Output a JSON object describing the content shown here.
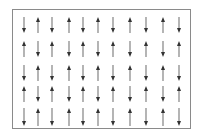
{
  "diagram": {
    "type": "spin-lattice",
    "frame_color": "#8a8a8a",
    "arrow_color": "#333333",
    "columns_x": [
      24,
      38,
      52,
      69,
      83,
      98,
      113,
      130,
      146,
      163,
      179
    ],
    "rows": [
      {
        "y_top": 17,
        "y_bottom": 33,
        "dirs": [
          "down",
          "up",
          "down",
          "up",
          "down",
          "up",
          "down",
          "up",
          "down",
          "up",
          "down"
        ]
      },
      {
        "y_top": 41,
        "y_bottom": 57,
        "dirs": [
          "up",
          "down",
          "up",
          "down",
          "up",
          "down",
          "up",
          "down",
          "up",
          "down",
          "up"
        ]
      },
      {
        "y_top": 65,
        "y_bottom": 81,
        "dirs": [
          "down",
          "up",
          "down",
          "up",
          "down",
          "up",
          "down",
          "up",
          "down",
          "up",
          "down"
        ]
      },
      {
        "y_top": 86,
        "y_bottom": 102,
        "dirs": [
          "up",
          "down",
          "up",
          "down",
          "up",
          "down",
          "up",
          "down",
          "up",
          "down",
          "up"
        ]
      },
      {
        "y_top": 108,
        "y_bottom": 126,
        "dirs": [
          "down",
          "up",
          "down",
          "up",
          "down",
          "up",
          "down",
          "up",
          "down",
          "up",
          "down"
        ]
      }
    ]
  }
}
